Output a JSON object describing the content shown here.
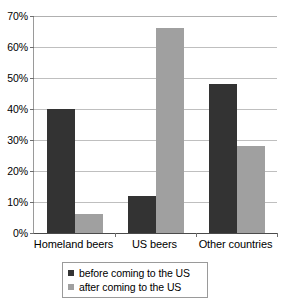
{
  "chart_data": {
    "type": "bar",
    "title": "",
    "subtitle": "",
    "xlabel": "",
    "ylabel": "",
    "categories": [
      "Homeland beers",
      "US beers",
      "Other countries"
    ],
    "series": [
      {
        "name": "before coming to the US",
        "color": "#333333",
        "values": [
          40,
          12,
          48
        ]
      },
      {
        "name": "after coming to the US",
        "color": "#a0a0a0",
        "values": [
          6,
          66,
          28
        ]
      }
    ],
    "ylim": [
      0,
      70
    ],
    "ytick_step": 10,
    "ytick_labels": [
      "70%",
      "60%",
      "50%",
      "40%",
      "30%",
      "20%",
      "10%",
      "0%"
    ],
    "ytick_values": [
      70,
      60,
      50,
      40,
      30,
      20,
      10,
      0
    ],
    "grid": true,
    "legend_position": "bottom",
    "value_suffix": "%"
  }
}
